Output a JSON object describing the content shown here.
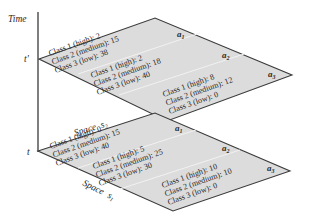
{
  "axes": {
    "time_label": "Time",
    "t_prime": "t'",
    "t": "t",
    "space_s2": "Space",
    "space_s2_var": "s",
    "space_s2_sub": "2",
    "space_s1": "Space",
    "space_s1_var": "s",
    "space_s1_sub": "1"
  },
  "colors": {
    "plane_fill": "#dcdcdc",
    "edge": "#3a3a3a",
    "divider": "#f2f2f2"
  },
  "planes": {
    "t_prime": {
      "areas": [
        {
          "name": "a",
          "sub": "1",
          "lines": [
            "Class 1 (high): 2",
            "Class 2 (medium): 15",
            "Class 3 (low): 38"
          ]
        },
        {
          "name": "a",
          "sub": "2",
          "lines": [
            "Class 1 (high): 2",
            "Class 2 (medium): 18",
            "Class 3 (low): 40"
          ]
        },
        {
          "name": "a",
          "sub": "3",
          "lines": [
            "Class 1 (high): 8",
            "Class 2 (medium): 12",
            "Class 3 (low): 0"
          ]
        }
      ]
    },
    "t": {
      "areas": [
        {
          "name": "a",
          "sub": "1",
          "lines": [
            "Class 1 (high): 0",
            "Class 2 (medium): 15",
            "Class 3 (low): 40"
          ]
        },
        {
          "name": "a",
          "sub": "2",
          "lines": [
            "Class 1 (high): 5",
            "Class 2 (medium): 25",
            "Class 3 (low): 30"
          ]
        },
        {
          "name": "a",
          "sub": "3",
          "lines": [
            "Class 1 (high): 10",
            "Class 2 (medium): 10",
            "Class 3 (low): 0"
          ]
        }
      ]
    }
  }
}
